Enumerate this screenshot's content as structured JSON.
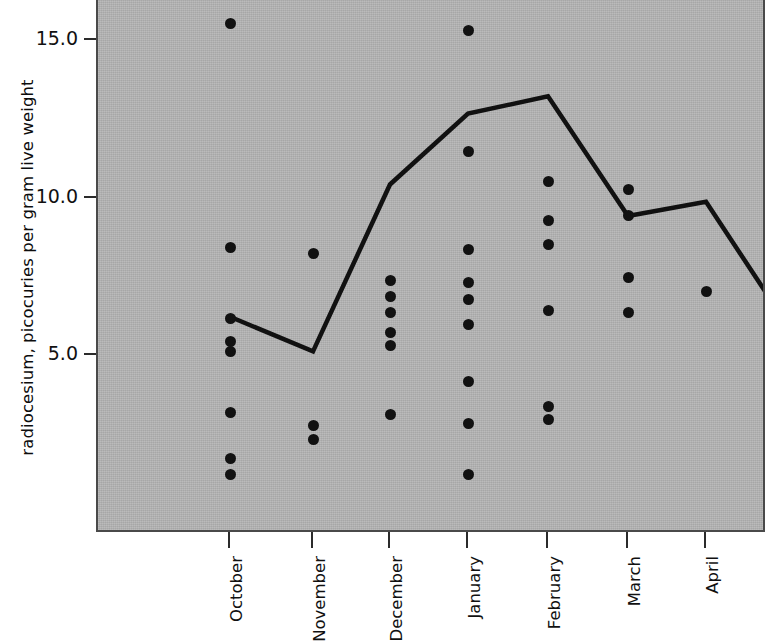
{
  "chart_data": {
    "type": "scatter",
    "title": "",
    "xlabel": "",
    "ylabel": "radiocesium, picocuries per gram live weight",
    "categories": [
      "October",
      "November",
      "December",
      "January",
      "February",
      "March",
      "April",
      "May"
    ],
    "ylim": [
      0.3,
      16.2
    ],
    "yticks": [
      5.0,
      10.0,
      15.0
    ],
    "ytick_labels": [
      "5.0",
      "10.0",
      "15.0"
    ],
    "grid": false,
    "legend": null,
    "series": [
      {
        "name": "individual measurements",
        "type": "scatter",
        "marker": "filled-circle",
        "color": "#111111",
        "points": [
          {
            "category": "October",
            "values": [
              15.45,
              8.35,
              6.1,
              5.35,
              5.05,
              3.1,
              1.65,
              1.15
            ]
          },
          {
            "category": "November",
            "values": [
              8.15,
              2.7,
              2.25
            ]
          },
          {
            "category": "December",
            "values": [
              7.3,
              6.8,
              6.3,
              5.65,
              5.25,
              3.05
            ]
          },
          {
            "category": "January",
            "values": [
              15.25,
              11.4,
              8.3,
              7.25,
              6.7,
              5.9,
              4.1,
              2.75,
              1.15
            ]
          },
          {
            "category": "February",
            "values": [
              10.45,
              9.2,
              8.45,
              6.35,
              3.3,
              2.9
            ]
          },
          {
            "category": "March",
            "values": [
              10.2,
              9.35,
              7.4,
              6.3
            ]
          },
          {
            "category": "April",
            "values": [
              6.95
            ]
          },
          {
            "category": "May",
            "values": [
              7.7,
              5.7,
              4.1,
              3.7,
              3.15,
              2.8,
              1.9,
              0.7
            ]
          }
        ]
      },
      {
        "name": "monthly mean",
        "type": "line",
        "color": "#111111",
        "values": [
          6.15,
          5.05,
          10.35,
          12.6,
          13.15,
          9.35,
          9.8,
          6.05
        ]
      }
    ],
    "colors": {
      "plot_background": "#b3b3b3",
      "marker": "#111111",
      "line": "#111111",
      "axis": "#2b2b2b",
      "text": "#111111",
      "page_background": "#ffffff"
    }
  }
}
